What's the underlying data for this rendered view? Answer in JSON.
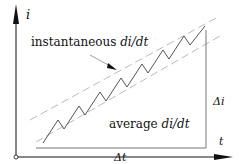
{
  "diagram": {
    "axes": {
      "y_label": "i",
      "x_label": "t"
    },
    "annotations": {
      "instantaneous_prefix": "instantaneous ",
      "instantaneous_expr": "di/dt",
      "average_prefix": "average ",
      "average_expr": "di/dt",
      "delta_i": "Δi",
      "delta_t": "Δt"
    },
    "colors": {
      "axis": "#111111",
      "waveform": "#555555",
      "guide_dashed": "#bbbbbb",
      "bracket": "#777777",
      "text": "#111111"
    }
  }
}
